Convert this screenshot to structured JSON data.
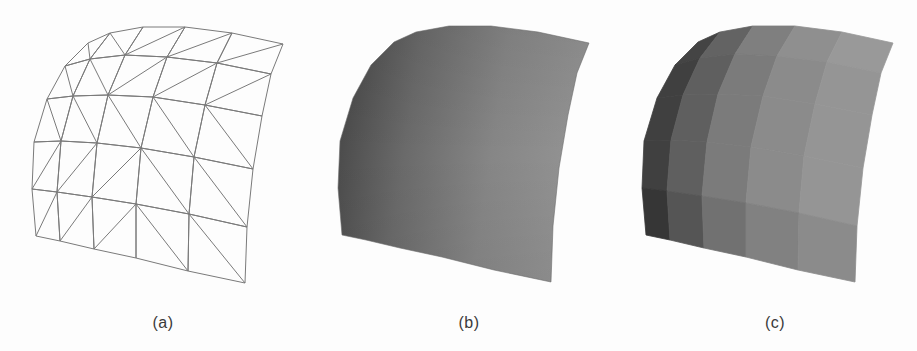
{
  "figure": {
    "panels": [
      {
        "id": "a",
        "label": "(a)",
        "style": "wireframe",
        "offset": [
          0,
          0
        ]
      },
      {
        "id": "b",
        "label": "(b)",
        "style": "smooth-shaded",
        "offset": [
          306,
          -1
        ]
      },
      {
        "id": "c",
        "label": "(c)",
        "style": "flat-shaded",
        "offset": [
          610,
          -1
        ]
      }
    ],
    "colors": {
      "background": "#fdfdfd",
      "wire": "#7a7a7a",
      "label": "#3a3a3a",
      "smooth_gradient": [
        "#434343",
        "#6a6a6a",
        "#868686",
        "#939393"
      ],
      "flat_columns": [
        "#404040",
        "#5f5f5f",
        "#7b7b7b",
        "#8b8b8b",
        "#959595"
      ],
      "flat_row_shift": [
        4,
        0,
        0,
        0,
        -10
      ]
    },
    "mesh": {
      "rows": 6,
      "cols": 6,
      "vertices": [
        [
          [
            88,
            43
          ],
          [
            110,
            33
          ],
          [
            143,
            27
          ],
          [
            185,
            27
          ],
          [
            232,
            33
          ],
          [
            283,
            44
          ]
        ],
        [
          [
            65,
            66
          ],
          [
            90,
            59
          ],
          [
            125,
            55
          ],
          [
            167,
            57
          ],
          [
            217,
            63
          ],
          [
            271,
            74
          ]
        ],
        [
          [
            47,
            99
          ],
          [
            73,
            96
          ],
          [
            108,
            95
          ],
          [
            153,
            97
          ],
          [
            205,
            105
          ],
          [
            262,
            116
          ]
        ],
        [
          [
            34,
            142
          ],
          [
            61,
            141
          ],
          [
            97,
            143
          ],
          [
            141,
            148
          ],
          [
            194,
            157
          ],
          [
            253,
            169
          ]
        ],
        [
          [
            32,
            189
          ],
          [
            57,
            192
          ],
          [
            92,
            197
          ],
          [
            136,
            204
          ],
          [
            189,
            214
          ],
          [
            247,
            227
          ]
        ],
        [
          [
            36,
            236
          ],
          [
            60,
            241
          ],
          [
            94,
            249
          ],
          [
            136,
            258
          ],
          [
            188,
            271
          ],
          [
            245,
            283
          ]
        ]
      ],
      "diagonals": [
        [
          "TLBR",
          "TLBR",
          "TRBL",
          "TRBL",
          "TRBL"
        ],
        [
          "TLBR",
          "TLBR",
          "TRBL",
          "TRBL",
          "TRBL"
        ],
        [
          "TLBR",
          "TLBR",
          "TLBR",
          "TLBR",
          "TLBR"
        ],
        [
          "TRBL",
          "TRBL",
          "TRBL",
          "TLBR",
          "TLBR"
        ],
        [
          "TRBL",
          "TRBL",
          "TRBL",
          "TLBR",
          "TLBR"
        ]
      ]
    }
  }
}
